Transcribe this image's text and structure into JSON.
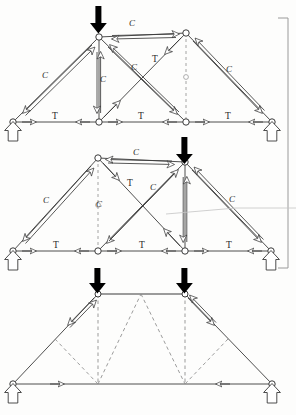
{
  "figure": {
    "background_color": "#fdfdfc",
    "line_color": "#3a3a3a",
    "load_color": "#000000",
    "dashed_color": "#777777",
    "faint_color": "#bdbdbd"
  },
  "labels": {
    "compression": "C",
    "tension": "T"
  },
  "trusses": [
    {
      "id": "truss-top",
      "name": "truss-diagram-1",
      "span_left_x": 13,
      "span_right_x": 272,
      "bottom_chord_y": 122,
      "apex": {
        "x": 99,
        "y": 37
      },
      "right_top": {
        "x": 186,
        "y": 33
      },
      "bottom_nodes_x": [
        13,
        99,
        186,
        272
      ],
      "loads": [
        {
          "at_x": 99,
          "at_y": 37,
          "direction": "down"
        }
      ],
      "supports": [
        {
          "x": 13,
          "y": 122
        },
        {
          "x": 272,
          "y": 122
        }
      ],
      "member_labels": [
        {
          "text": "C",
          "x": 45,
          "y": 78,
          "member": "left-rafter"
        },
        {
          "text": "C",
          "x": 132,
          "y": 26,
          "member": "top-chord-right"
        },
        {
          "text": "C",
          "x": 103,
          "y": 82,
          "member": "king-post-vertical"
        },
        {
          "text": "C",
          "x": 134,
          "y": 70,
          "member": "diagonal-compression"
        },
        {
          "text": "T",
          "x": 154,
          "y": 62,
          "member": "diagonal-tension"
        },
        {
          "text": "C",
          "x": 229,
          "y": 72,
          "member": "right-rafter"
        },
        {
          "text": "T",
          "x": 53,
          "y": 118,
          "member": "bottom-chord-left"
        },
        {
          "text": "T",
          "x": 140,
          "y": 118,
          "member": "bottom-chord-mid"
        },
        {
          "text": "T",
          "x": 227,
          "y": 118,
          "member": "bottom-chord-right"
        }
      ]
    },
    {
      "id": "truss-middle",
      "name": "truss-diagram-2",
      "span_left_x": 13,
      "span_right_x": 271,
      "bottom_chord_y": 251,
      "apex": {
        "x": 185,
        "y": 162
      },
      "left_top": {
        "x": 98,
        "y": 158
      },
      "bottom_nodes_x": [
        13,
        98,
        185,
        271
      ],
      "loads": [
        {
          "at_x": 185,
          "at_y": 162,
          "direction": "down"
        }
      ],
      "supports": [
        {
          "x": 13,
          "y": 251
        },
        {
          "x": 271,
          "y": 251
        }
      ],
      "member_labels": [
        {
          "text": "C",
          "x": 136,
          "y": 155,
          "member": "top-chord-left"
        },
        {
          "text": "C",
          "x": 46,
          "y": 203,
          "member": "left-rafter"
        },
        {
          "text": "C",
          "x": 99,
          "y": 207,
          "member": "queen-post-vertical"
        },
        {
          "text": "T",
          "x": 129,
          "y": 185,
          "member": "diagonal-tension"
        },
        {
          "text": "C",
          "x": 152,
          "y": 190,
          "member": "diagonal-compression"
        },
        {
          "text": "C",
          "x": 232,
          "y": 202,
          "member": "right-rafter"
        },
        {
          "text": "T",
          "x": 55,
          "y": 247,
          "member": "bottom-chord-left"
        },
        {
          "text": "T",
          "x": 141,
          "y": 247,
          "member": "bottom-chord-mid"
        },
        {
          "text": "T",
          "x": 228,
          "y": 247,
          "member": "bottom-chord-right"
        }
      ]
    },
    {
      "id": "truss-bottom",
      "name": "truss-diagram-3",
      "span_left_x": 13,
      "span_right_x": 272,
      "bottom_chord_y": 384,
      "top_left": {
        "x": 98,
        "y": 294
      },
      "top_right": {
        "x": 185,
        "y": 294
      },
      "bottom_nodes_x": [
        13,
        98,
        185,
        272
      ],
      "loads": [
        {
          "at_x": 98,
          "at_y": 294,
          "direction": "down"
        },
        {
          "at_x": 185,
          "at_y": 294,
          "direction": "down"
        }
      ],
      "supports": [
        {
          "x": 13,
          "y": 384
        },
        {
          "x": 272,
          "y": 384
        }
      ],
      "member_labels": []
    }
  ],
  "annotations": {
    "right_bracket": {
      "x": 288,
      "y_top": 18,
      "y_bottom": 268,
      "tick_length": 10
    },
    "leader_line": {
      "from_x": 166,
      "from_y": 214,
      "to_x": 296,
      "to_y": 208
    }
  }
}
